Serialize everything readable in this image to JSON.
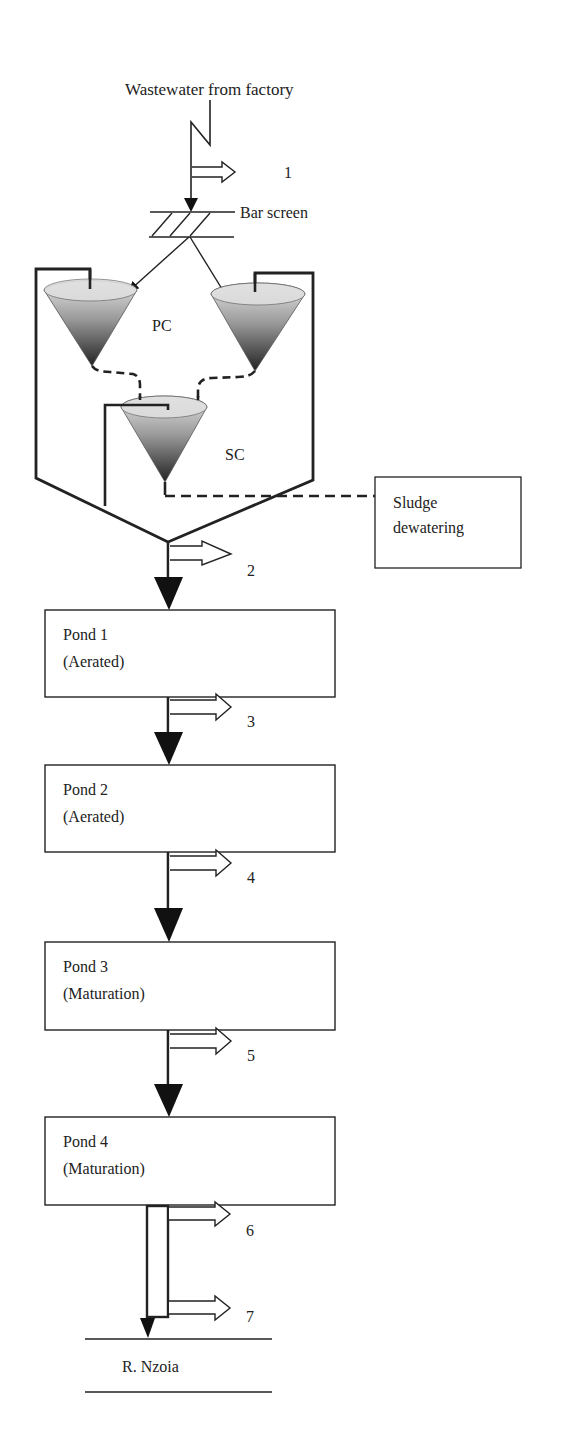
{
  "diagram": {
    "title": "Wastewater from factory",
    "bar_screen_label": "Bar screen",
    "primary_clarifier_label": "PC",
    "secondary_clarifier_label": "SC",
    "sludge_box": {
      "line1": "Sludge",
      "line2": "dewatering"
    },
    "ponds": [
      {
        "name": "Pond 1",
        "type": "(Aerated)"
      },
      {
        "name": "Pond 2",
        "type": "(Aerated)"
      },
      {
        "name": "Pond 3",
        "type": "(Maturation)"
      },
      {
        "name": "Pond 4",
        "type": "(Maturation)"
      }
    ],
    "sampling_points": [
      "1",
      "2",
      "3",
      "4",
      "5",
      "6",
      "7"
    ],
    "river_label": "R. Nzoia",
    "colors": {
      "stroke": "#222222",
      "cone_top": "#d8d8d8",
      "cone_bottom": "#2a2a2a",
      "background": "#ffffff"
    }
  }
}
